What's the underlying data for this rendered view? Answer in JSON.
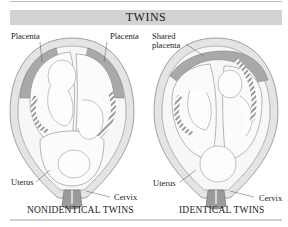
{
  "title": "TWINS",
  "colors": {
    "title_bar": "#d2d2d2",
    "uterus_wall": "#e4e4e4",
    "placenta": "#a9a9a9",
    "cervix": "#9b9b9b",
    "outline": "#7a7a7a",
    "rule": "#cfcfcf"
  },
  "left_panel": {
    "caption": "NONIDENTICAL TWINS",
    "labels": {
      "placenta_left": "Placenta",
      "placenta_right": "Placenta",
      "uterus": "Uterus",
      "cervix": "Cervix"
    }
  },
  "right_panel": {
    "caption": "IDENTICAL TWINS",
    "labels": {
      "shared_placenta_line1": "Shared",
      "shared_placenta_line2": "placenta",
      "uterus": "Uterus",
      "cervix": "Cervix"
    }
  }
}
